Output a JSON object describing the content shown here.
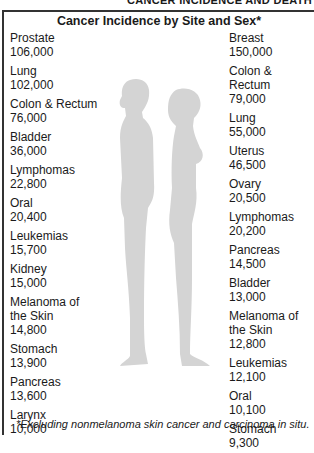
{
  "running_head": "CANCER INCIDENCE AND DEATH",
  "title": "Cancer Incidence by Site and Sex*",
  "male": {
    "sex": "Male",
    "items": [
      {
        "site": "Prostate",
        "value": "106,000"
      },
      {
        "site": "Lung",
        "value": "102,000"
      },
      {
        "site": "Colon & Rectum",
        "value": "76,000"
      },
      {
        "site": "Bladder",
        "value": "36,000"
      },
      {
        "site": "Lymphomas",
        "value": "22,800"
      },
      {
        "site": "Oral",
        "value": "20,400"
      },
      {
        "site": "Leukemias",
        "value": "15,700"
      },
      {
        "site": "Kidney",
        "value": "15,000"
      },
      {
        "site": "Melanoma of\nthe Skin",
        "value": "14,800"
      },
      {
        "site": "Stomach",
        "value": "13,900"
      },
      {
        "site": "Pancreas",
        "value": "13,600"
      },
      {
        "site": "Larynx",
        "value": "10,000"
      }
    ]
  },
  "female": {
    "sex": "Female",
    "items": [
      {
        "site": "Breast",
        "value": "150,000"
      },
      {
        "site": "Colon & Rectum",
        "value": "79,000"
      },
      {
        "site": "Lung",
        "value": "55,000"
      },
      {
        "site": "Uterus",
        "value": "46,500"
      },
      {
        "site": "Ovary",
        "value": "20,500"
      },
      {
        "site": "Lymphomas",
        "value": "20,200"
      },
      {
        "site": "Pancreas",
        "value": "14,500"
      },
      {
        "site": "Bladder",
        "value": "13,000"
      },
      {
        "site": "Melanoma of\nthe Skin",
        "value": "12,800"
      },
      {
        "site": "Leukemias",
        "value": "12,100"
      },
      {
        "site": "Oral",
        "value": "10,100"
      },
      {
        "site": "Stomach",
        "value": "9,300"
      }
    ]
  },
  "silhouette_color": "#d4d4d4",
  "footnote": "*Excluding nonmelanoma skin cancer and carcinoma in situ."
}
